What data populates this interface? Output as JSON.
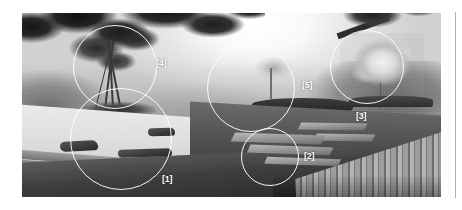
{
  "figure": {
    "name": "annotated-garden-photograph",
    "alt": "Black and white photograph of a Japanese garden with raked gravel, stepping stones, moss lawn and a wooden deck",
    "annotation_color": "#ffffff",
    "annotations": [
      {
        "id": "1",
        "label": "[1]",
        "subject": "raked-gravel-with-stones",
        "circle": {
          "cx": 121,
          "cy": 139,
          "r": 51
        },
        "label_pos": {
          "x": 162,
          "y": 175
        }
      },
      {
        "id": "2",
        "label": "[2]",
        "subject": "stepping-stones-in-moss",
        "circle": {
          "cx": 270,
          "cy": 157,
          "r": 29
        },
        "label_pos": {
          "x": 304,
          "y": 152
        }
      },
      {
        "id": "3",
        "label": "[3]",
        "subject": "bright-deciduous-tree",
        "circle": {
          "cx": 367,
          "cy": 67,
          "r": 37
        },
        "label_pos": {
          "x": 356,
          "y": 112
        }
      },
      {
        "id": "4",
        "label": "[4]",
        "subject": "multi-trunk-foreground-tree",
        "circle": {
          "cx": 115,
          "cy": 67,
          "r": 42
        },
        "label_pos": {
          "x": 156,
          "y": 59
        }
      },
      {
        "id": "5",
        "label": "[5]",
        "subject": "distant-tree-and-hedge",
        "circle": {
          "cx": 251,
          "cy": 88,
          "r": 44
        },
        "label_pos": {
          "x": 302,
          "y": 81
        }
      }
    ]
  },
  "divider": {
    "name": "right-column-rule",
    "color": "#b0b0b0"
  }
}
